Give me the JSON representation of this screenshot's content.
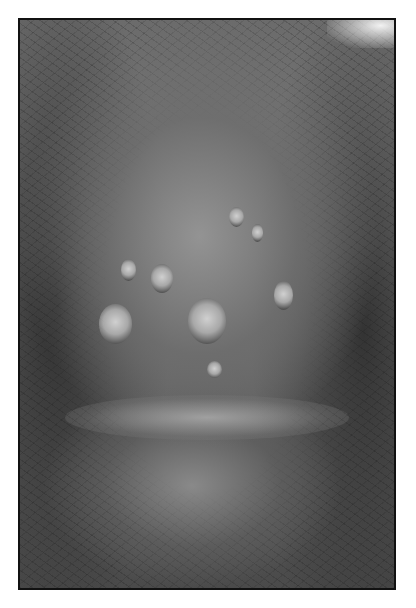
{
  "image": {
    "type": "grayscale clinical photograph",
    "alt": "Close-up grayscale clinical photograph showing multiple ulcerated lesions on skin, framed with a thin black border"
  }
}
